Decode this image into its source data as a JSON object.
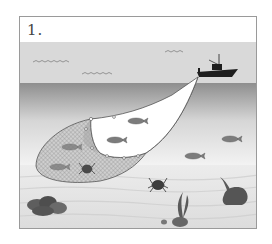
{
  "figure": {
    "label": "1."
  },
  "colors": {
    "sky": "#d8d8d8",
    "water_top": "#8c8c8c",
    "water_bottom": "#f0f0f0",
    "seabed": "#e2e2e2",
    "net_fill": "#c8c8c8",
    "boat": "#1e1e1e",
    "rock": "#5a5a5a",
    "frame_border": "#9a9a9a"
  },
  "elements": {
    "boat": "fishing-boat",
    "net": "trawl-net",
    "fish_count_outside_net": 4,
    "fish_count_in_net": 2,
    "crabs": 2,
    "seaweed": 2,
    "rock_clusters": 3,
    "sky_waves": 3
  }
}
